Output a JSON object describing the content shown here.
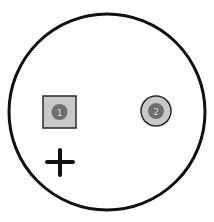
{
  "diagram": {
    "type": "capacitor-footprint",
    "outline": {
      "shape": "circle",
      "stroke": "#111111",
      "fill": "#ffffff"
    },
    "polarity_mark": {
      "symbol": "+",
      "color": "#111111"
    },
    "pins": [
      {
        "number": "1",
        "pad_shape": "square",
        "pad_fill": "#c8c8c8",
        "pad_stroke": "#2a2a2a",
        "dot_fill": "#6e6e6e"
      },
      {
        "number": "2",
        "pad_shape": "round",
        "pad_fill": "#c8c8c8",
        "pad_stroke": "#2a2a2a",
        "dot_fill": "#6e6e6e"
      }
    ]
  }
}
